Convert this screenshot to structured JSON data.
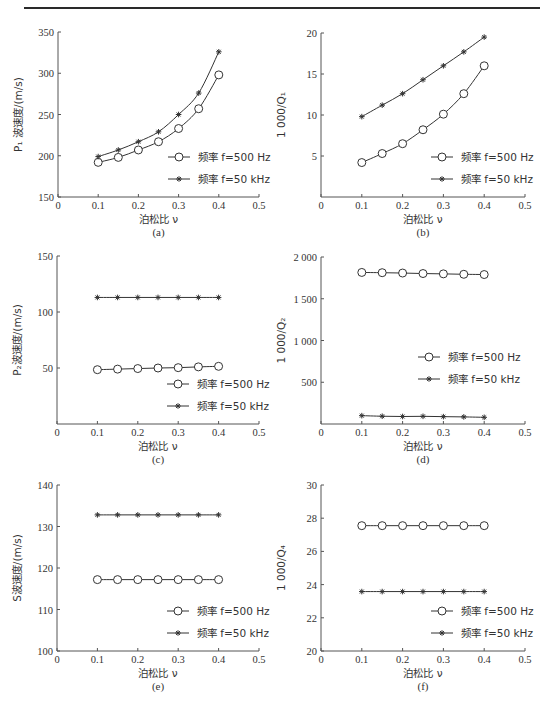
{
  "figure": {
    "width": 560,
    "height": 716,
    "legend_labels": [
      "频率 f=500 Hz",
      "频率 f=50 kHz"
    ]
  },
  "chart_data": [
    {
      "id": "a",
      "type": "line",
      "caption": "(a)",
      "title": "",
      "xlabel": "泊松比 ν",
      "ylabel": "P₁ 波速度/(m/s)",
      "xlim": [
        0,
        0.5
      ],
      "ylim": [
        150,
        350
      ],
      "xticks": [
        0,
        0.1,
        0.2,
        0.3,
        0.4,
        0.5
      ],
      "xtick_labels": [
        "0",
        "0.1",
        "0.2",
        "0.3",
        "0.4",
        "0.5"
      ],
      "yticks": [
        150,
        200,
        250,
        300,
        350
      ],
      "ytick_labels": [
        "150",
        "200",
        "250",
        "300",
        "350"
      ],
      "grid": false,
      "legend_position": "lower right",
      "x": [
        0.1,
        0.15,
        0.2,
        0.25,
        0.3,
        0.35,
        0.4
      ],
      "series": [
        {
          "name": "频率 f=500 Hz",
          "marker": "circle",
          "values": [
            192,
            198,
            207,
            217,
            233,
            257,
            298
          ]
        },
        {
          "name": "频率 f=50 kHz",
          "marker": "star",
          "values": [
            199,
            207,
            217,
            229,
            250,
            276,
            326
          ]
        }
      ],
      "frame": {
        "x0": 58,
        "x1": 259,
        "y0": 32,
        "y1": 197
      }
    },
    {
      "id": "b",
      "type": "line",
      "caption": "(b)",
      "title": "",
      "xlabel": "泊松比 ν",
      "ylabel": "1 000/Q₁",
      "xlim": [
        0,
        0.5
      ],
      "ylim": [
        0,
        20
      ],
      "xticks": [
        0,
        0.1,
        0.2,
        0.3,
        0.4,
        0.5
      ],
      "xtick_labels": [
        "0",
        "0.1",
        "0.2",
        "0.3",
        "0.4",
        "0.5"
      ],
      "yticks": [
        5,
        10,
        15,
        20
      ],
      "ytick_labels": [
        "5",
        "10",
        "15",
        "20"
      ],
      "grid": false,
      "legend_position": "lower right",
      "x": [
        0.1,
        0.15,
        0.2,
        0.25,
        0.3,
        0.35,
        0.4
      ],
      "series": [
        {
          "name": "频率 f=500 Hz",
          "marker": "circle",
          "values": [
            4.2,
            5.3,
            6.5,
            8.2,
            10.1,
            12.6,
            16.0
          ]
        },
        {
          "name": "频率 f=50 kHz",
          "marker": "star",
          "values": [
            9.8,
            11.2,
            12.6,
            14.3,
            16.0,
            17.7,
            19.5
          ]
        }
      ],
      "frame": {
        "x0": 321,
        "x1": 525,
        "y0": 33,
        "y1": 197
      }
    },
    {
      "id": "c",
      "type": "line",
      "caption": "(c)",
      "title": "",
      "xlabel": "泊松比 ν",
      "ylabel": "P₂波速度/(m/s)",
      "xlim": [
        0,
        0.5
      ],
      "ylim": [
        0,
        150
      ],
      "xticks": [
        0,
        0.1,
        0.2,
        0.3,
        0.4,
        0.5
      ],
      "xtick_labels": [
        "0",
        "0.1",
        "0.2",
        "0.3",
        "0.4",
        "0.5"
      ],
      "yticks": [
        50,
        100,
        150
      ],
      "ytick_labels": [
        "50",
        "100",
        "150"
      ],
      "grid": false,
      "legend_position": "lower right",
      "x": [
        0.1,
        0.15,
        0.2,
        0.25,
        0.3,
        0.35,
        0.4
      ],
      "series": [
        {
          "name": "频率 f=500 Hz",
          "marker": "circle",
          "values": [
            48.5,
            49,
            49.5,
            50,
            50.3,
            51,
            51.5
          ]
        },
        {
          "name": "频率 f=50 kHz",
          "marker": "star",
          "values": [
            113,
            113,
            113,
            113,
            113,
            113,
            113
          ]
        }
      ],
      "frame": {
        "x0": 57,
        "x1": 259,
        "y0": 256,
        "y1": 424
      }
    },
    {
      "id": "d",
      "type": "line",
      "caption": "(d)",
      "title": "",
      "xlabel": "泊松比 ν",
      "ylabel": "1 000/Q₂",
      "xlim": [
        0,
        0.5
      ],
      "ylim": [
        0,
        2000
      ],
      "xticks": [
        0,
        0.1,
        0.2,
        0.3,
        0.4,
        0.5
      ],
      "xtick_labels": [
        "0",
        "0.1",
        "0.2",
        "0.3",
        "0.4",
        "0.5"
      ],
      "yticks": [
        500,
        1000,
        1500,
        2000
      ],
      "ytick_labels": [
        "500",
        "1 000",
        "1 500",
        "2 000"
      ],
      "grid": false,
      "legend_position": "center right",
      "x": [
        0.1,
        0.15,
        0.2,
        0.25,
        0.3,
        0.35,
        0.4
      ],
      "series": [
        {
          "name": "频率 f=500 Hz",
          "marker": "circle",
          "values": [
            1815,
            1812,
            1808,
            1802,
            1798,
            1793,
            1790
          ]
        },
        {
          "name": "频率 f=50 kHz",
          "marker": "star",
          "values": [
            100,
            93,
            90,
            92,
            88,
            85,
            80
          ]
        }
      ],
      "frame": {
        "x0": 321,
        "x1": 525,
        "y0": 257,
        "y1": 424
      }
    },
    {
      "id": "e",
      "type": "line",
      "caption": "(e)",
      "title": "",
      "xlabel": "泊松比 ν",
      "ylabel": "S波速度/(m/s)",
      "xlim": [
        0,
        0.5
      ],
      "ylim": [
        100,
        140
      ],
      "xticks": [
        0,
        0.1,
        0.2,
        0.3,
        0.4,
        0.5
      ],
      "xtick_labels": [
        "0",
        "0.1",
        "0.2",
        "0.3",
        "0.4",
        "0.5"
      ],
      "yticks": [
        100,
        110,
        120,
        130,
        140
      ],
      "ytick_labels": [
        "100",
        "110",
        "120",
        "130",
        "140"
      ],
      "grid": false,
      "legend_position": "lower right",
      "x": [
        0.1,
        0.15,
        0.2,
        0.25,
        0.3,
        0.35,
        0.4
      ],
      "series": [
        {
          "name": "频率 f=500 Hz",
          "marker": "circle",
          "values": [
            117.2,
            117.2,
            117.2,
            117.2,
            117.2,
            117.2,
            117.2
          ]
        },
        {
          "name": "频率 f=50 kHz",
          "marker": "star",
          "values": [
            132.8,
            132.8,
            132.8,
            132.8,
            132.8,
            132.8,
            132.8
          ]
        }
      ],
      "frame": {
        "x0": 57,
        "x1": 259,
        "y0": 485,
        "y1": 651
      }
    },
    {
      "id": "f",
      "type": "line",
      "caption": "(f)",
      "title": "",
      "xlabel": "泊松比 ν",
      "ylabel": "1 000/Q₄",
      "xlim": [
        0,
        0.5
      ],
      "ylim": [
        20,
        30
      ],
      "xticks": [
        0,
        0.1,
        0.2,
        0.3,
        0.4,
        0.5
      ],
      "xtick_labels": [
        "0",
        "0.1",
        "0.2",
        "0.3",
        "0.4",
        "0.5"
      ],
      "yticks": [
        20,
        22,
        24,
        26,
        28,
        30
      ],
      "ytick_labels": [
        "20",
        "22",
        "24",
        "26",
        "28",
        "30"
      ],
      "grid": false,
      "legend_position": "lower right",
      "x": [
        0.1,
        0.15,
        0.2,
        0.25,
        0.3,
        0.35,
        0.4
      ],
      "series": [
        {
          "name": "频率 f=500 Hz",
          "marker": "circle",
          "values": [
            27.55,
            27.55,
            27.55,
            27.55,
            27.55,
            27.55,
            27.55
          ]
        },
        {
          "name": "频率 f=50 kHz",
          "marker": "star",
          "values": [
            23.58,
            23.58,
            23.58,
            23.58,
            23.58,
            23.58,
            23.58
          ]
        }
      ],
      "frame": {
        "x0": 321,
        "x1": 525,
        "y0": 485,
        "y1": 651
      }
    }
  ]
}
